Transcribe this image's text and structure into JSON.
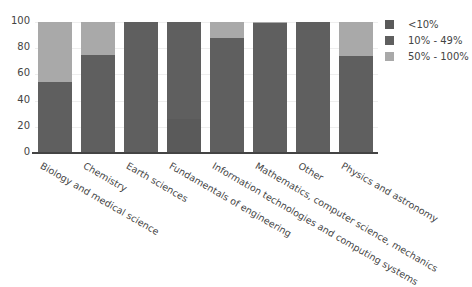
{
  "chart_data": {
    "type": "bar",
    "stacked": true,
    "title": "",
    "xlabel": "",
    "ylabel": "",
    "ylim": [
      0,
      100
    ],
    "yticks": [
      0,
      20,
      40,
      60,
      80,
      100
    ],
    "grid": true,
    "legend_position": "right",
    "categories": [
      "Biology and medical science",
      "Chemistry",
      "Earth sciences",
      "Fundamentals of engineering",
      "Information technologies and computing systems",
      "Mathematics, computer science, mechanics",
      "Other",
      "Physics and astronomy"
    ],
    "series": [
      {
        "name": "<10%",
        "color": "#5a5a5a",
        "values": [
          0,
          0,
          0,
          26,
          0,
          0,
          0,
          0
        ]
      },
      {
        "name": "10% - 49%",
        "color": "#5f5f5f",
        "values": [
          54,
          75,
          100,
          74,
          88,
          99,
          100,
          74
        ]
      },
      {
        "name": "50% - 100%",
        "color": "#a9a9a9",
        "values": [
          46,
          25,
          0,
          0,
          12,
          1,
          0,
          26
        ]
      }
    ]
  }
}
